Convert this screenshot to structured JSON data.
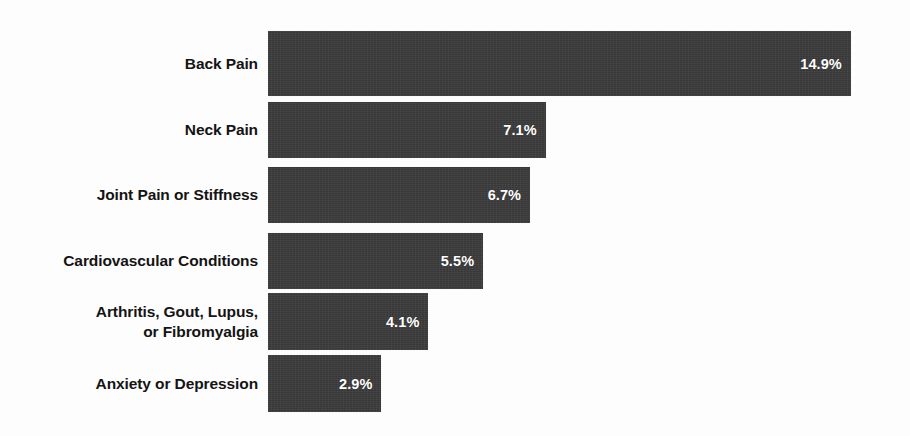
{
  "chart_data": {
    "type": "bar",
    "orientation": "horizontal",
    "title": "",
    "subtitle": "",
    "xlabel": "",
    "ylabel": "",
    "grid": false,
    "legend": null,
    "xlim": [
      0,
      15.9
    ],
    "categories": [
      "Back Pain",
      "Neck Pain",
      "Joint Pain or Stiffness",
      "Cardiovascular Conditions",
      "Arthritis, Gout, Lupus,\nor Fibromyalgia",
      "Anxiety or Depression"
    ],
    "values": [
      14.9,
      7.1,
      6.7,
      5.5,
      4.1,
      2.9
    ],
    "value_labels": [
      "14.9%",
      "7.1%",
      "6.7%",
      "5.5%",
      "4.1%",
      "2.9%"
    ],
    "bar_color": "#3b3b3b",
    "value_label_color": "#ffffff",
    "category_label_color": "#141414",
    "background_color": "#fdfdfd"
  },
  "footer": {
    "artifact_text": ""
  }
}
